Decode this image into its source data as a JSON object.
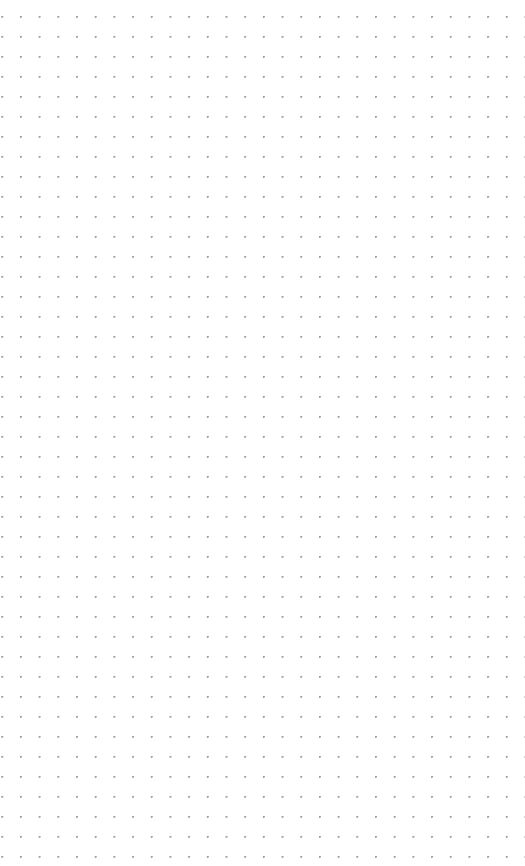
{
  "canvas": {
    "name": "dot-grid-canvas",
    "width": 525,
    "height": 866,
    "background_color": "#ffffff",
    "content_state": "empty",
    "content_label": "",
    "grid": {
      "style": "dotted",
      "visible": true,
      "dot_color": "#9b9ba6",
      "dot_radius_px": 0.75,
      "spacing_x_px": 18.7,
      "spacing_y_px": 20,
      "origin_x_px": 1.3,
      "origin_y_px": 16,
      "columns": 27,
      "rows": 41,
      "first_dot_x_px": 20,
      "first_dot_y_px": 36,
      "last_dot_x_px": 487,
      "last_dot_y_px": 832,
      "top_margin_px": 36,
      "bottom_margin_px": 34,
      "left_margin_px": 20,
      "right_margin_px": 38
    }
  }
}
